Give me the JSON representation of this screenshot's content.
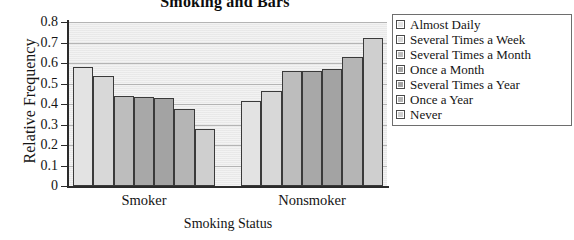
{
  "chart_data": {
    "type": "bar",
    "title": "Smoking and Bars",
    "xlabel": "Smoking Status",
    "ylabel": "Relative Frequency",
    "categories": [
      "Smoker",
      "Nonsmoker"
    ],
    "ylim": [
      0,
      0.8
    ],
    "ytick_labels": [
      "0.8",
      "0.7",
      "0.6",
      "0.5",
      "0.4",
      "0.3",
      "0.2",
      "0.1",
      "0"
    ],
    "ytick_values": [
      0.8,
      0.7,
      0.6,
      0.5,
      0.4,
      0.3,
      0.2,
      0.1,
      0
    ],
    "grid": true,
    "legend_position": "right",
    "series": [
      {
        "name": "Almost Daily",
        "color": "#e3e3e3",
        "values": [
          0.58,
          0.415
        ]
      },
      {
        "name": "Several Times a Week",
        "color": "#d8d8d8",
        "values": [
          0.535,
          0.465
        ]
      },
      {
        "name": "Several Times a Month",
        "color": "#bdbdbd",
        "values": [
          0.44,
          0.56
        ]
      },
      {
        "name": "Once a Month",
        "color": "#a8a8a8",
        "values": [
          0.435,
          0.562
        ]
      },
      {
        "name": "Several Times a Year",
        "color": "#a3a3a3",
        "values": [
          0.43,
          0.57
        ]
      },
      {
        "name": "Once a Year",
        "color": "#b5b5b5",
        "values": [
          0.375,
          0.63
        ]
      },
      {
        "name": "Never",
        "color": "#cfcfcf",
        "values": [
          0.28,
          0.72
        ]
      }
    ]
  }
}
